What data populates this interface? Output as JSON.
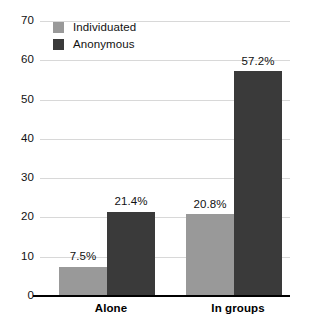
{
  "chart_data": {
    "type": "bar",
    "title": "",
    "subtitle": "",
    "xlabel": "",
    "ylabel": "",
    "categories": [
      "Alone",
      "In groups"
    ],
    "series": [
      {
        "name": "Individuated",
        "color": "#999999",
        "values": [
          7.5,
          20.8
        ],
        "labels": [
          "7.5%",
          "20.8%"
        ]
      },
      {
        "name": "Anonymous",
        "color": "#3a3a3a",
        "values": [
          21.4,
          57.2
        ],
        "labels": [
          "21.4%",
          "57.2%"
        ]
      }
    ],
    "ylim": [
      0,
      70
    ],
    "ytick_step": 10,
    "ytick_labels": [
      "0",
      "10",
      "20",
      "30",
      "40",
      "50",
      "60",
      "70"
    ],
    "ytick_values": [
      0,
      10,
      20,
      30,
      40,
      50,
      60,
      70
    ],
    "grid": true,
    "grid_color": "#d8d8d8",
    "legend_position": "top-left",
    "axis_color": "#000000",
    "background": "#ffffff"
  },
  "legend": {
    "items": [
      {
        "label": "Individuated",
        "color": "#999999"
      },
      {
        "label": "Anonymous",
        "color": "#3a3a3a"
      }
    ]
  },
  "axes": {
    "y": {
      "ticks": [
        {
          "label": "70",
          "value": 70
        },
        {
          "label": "60",
          "value": 60
        },
        {
          "label": "50",
          "value": 50
        },
        {
          "label": "40",
          "value": 40
        },
        {
          "label": "30",
          "value": 30
        },
        {
          "label": "20",
          "value": 20
        },
        {
          "label": "10",
          "value": 10
        },
        {
          "label": "0",
          "value": 0
        }
      ]
    },
    "x": {
      "categories": [
        {
          "label": "Alone"
        },
        {
          "label": "In groups"
        }
      ]
    }
  },
  "bars": [
    {
      "group": "Alone",
      "series": "Individuated",
      "value": 7.5,
      "label": "7.5%",
      "color": "#999999"
    },
    {
      "group": "Alone",
      "series": "Anonymous",
      "value": 21.4,
      "label": "21.4%",
      "color": "#3a3a3a"
    },
    {
      "group": "In groups",
      "series": "Individuated",
      "value": 20.8,
      "label": "20.8%",
      "color": "#999999"
    },
    {
      "group": "In groups",
      "series": "Anonymous",
      "value": 57.2,
      "label": "57.2%",
      "color": "#3a3a3a"
    }
  ]
}
